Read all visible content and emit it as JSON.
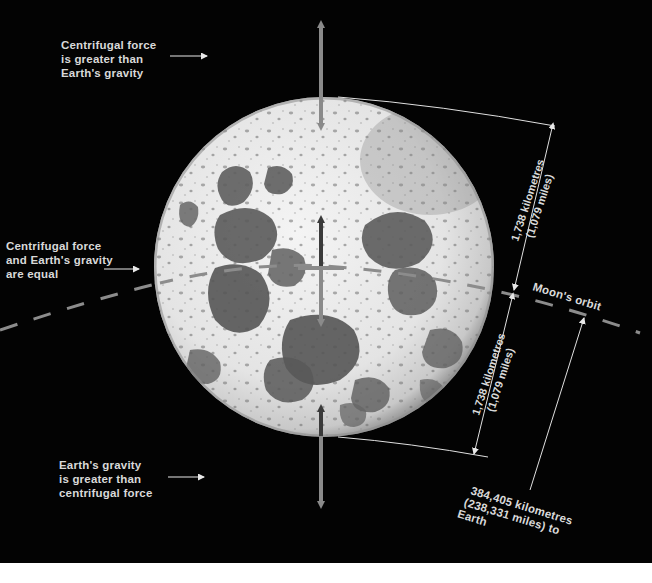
{
  "diagram": {
    "colors": {
      "background": "#030303",
      "text": "#d9d9d9",
      "arrow_grey": "#8a8a8a",
      "arrow_dark": "#3a3a3a",
      "orbit_dash": "#8c8c8c",
      "moon_light": "#ececec",
      "moon_mare": "#5c5c5c",
      "leader_line": "#e0e0e0"
    },
    "labels": {
      "top_left": {
        "lines": [
          "Centrifugal force",
          "is greater than",
          "Earth's gravity"
        ]
      },
      "middle_left": {
        "lines": [
          "Centrifugal force",
          "and Earth's gravity",
          "are equal"
        ]
      },
      "bottom_left": {
        "lines": [
          "Earth's gravity",
          "is greater than",
          "centrifugal force"
        ]
      },
      "orbit": "Moon's orbit",
      "radius_upper": {
        "lines": [
          "1,738 kilometres",
          "(1,079 miles)"
        ]
      },
      "radius_lower": {
        "lines": [
          "1,738 kilometres",
          "(1,079 miles)"
        ]
      },
      "earth_distance": {
        "lines": [
          "384,405 kilometres",
          "(238,331 miles) to",
          "Earth"
        ]
      }
    },
    "arrows": [
      {
        "name": "top-double-arrow",
        "from": [
          321,
          18
        ],
        "to": [
          321,
          133
        ],
        "style": "double",
        "color": "grey"
      },
      {
        "name": "center-double-arrow",
        "from": [
          321,
          213
        ],
        "to": [
          321,
          330
        ],
        "style": "double",
        "color": "dark-top-grey-bottom"
      },
      {
        "name": "bottom-double-arrow",
        "from": [
          321,
          402
        ],
        "to": [
          321,
          510
        ],
        "style": "double",
        "color": "dark-top-grey-bottom"
      }
    ]
  }
}
